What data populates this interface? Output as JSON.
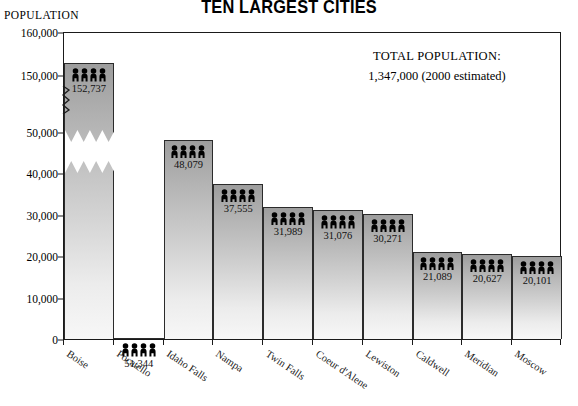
{
  "chart_data": {
    "type": "bar",
    "title": "TEN LARGEST CITIES",
    "ylabel": "POPULATION",
    "xlabel": "",
    "categories": [
      "Boise",
      "Pocatello",
      "Idaho Falls",
      "Nampa",
      "Twin Falls",
      "Coeur d'Alene",
      "Lewiston",
      "Caldwell",
      "Meridian",
      "Moscow"
    ],
    "values": [
      152737,
      51344,
      48079,
      37555,
      31989,
      31076,
      30271,
      21089,
      20627,
      20101
    ],
    "value_labels": [
      "152,737",
      "51,344",
      "48,079",
      "37,555",
      "31,989",
      "31,076",
      "30,271",
      "21,089",
      "20,627",
      "20,101"
    ],
    "ytick_labels": [
      "0",
      "10,000",
      "20,000",
      "30,000",
      "40,000",
      "50,000",
      "150,000",
      "160,000"
    ],
    "ytick_values": [
      0,
      10000,
      20000,
      30000,
      40000,
      50000,
      150000,
      160000
    ],
    "ylim": [
      0,
      160000
    ],
    "axis_break": {
      "present": true,
      "from": 50000,
      "to": 150000
    },
    "grid": false,
    "legend": null,
    "bar_icon": "four-people-icon",
    "colors": {
      "bar_top": "#9d9d9d",
      "bar_bottom": "#f7f7f7",
      "outline": "#2b2b2b",
      "text": "#000000"
    },
    "annotation": {
      "line1": "TOTAL POPULATION:",
      "line2": "1,347,000  (2000 estimated)"
    }
  }
}
